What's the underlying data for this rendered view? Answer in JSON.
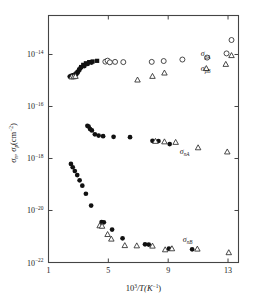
{
  "chart_data": {
    "type": "scatter",
    "title": "",
    "xlabel": "10^3/T(K^-1)",
    "xlabel_parts": {
      "base": "10",
      "exp": "3",
      "mid": "/T(K",
      "sup": "−1",
      "close": ")"
    },
    "ylabel": "σn , σp(cm−2)",
    "ylabel_parts": {
      "s1": "σ",
      "sub1": "n",
      "comma": ",",
      "s2": "σ",
      "sub2": "p",
      "unit": "(cm",
      "usup": "−2",
      "uclose": ")"
    },
    "xlim": [
      1,
      13.7
    ],
    "ylim": [
      1e-22,
      3.16e-13
    ],
    "xticks": [
      1,
      5,
      9,
      13
    ],
    "xticklabels": [
      "1",
      "5",
      "9",
      "13"
    ],
    "yticks": [
      1e-14,
      1e-16,
      1e-18,
      1e-20,
      1e-22
    ],
    "yticklabels": [
      "10−14",
      "10−16",
      "10−18",
      "10−20",
      "10−22"
    ],
    "ytick_exponents": [
      "-14",
      "-16",
      "-18",
      "-20",
      "-22"
    ],
    "grid": false,
    "legend_position": "inline-right",
    "xscale": "linear",
    "yscale": "log",
    "annotations": [
      {
        "name": "sigma-pA",
        "text": "σ",
        "sub": "pA",
        "x": 11.5,
        "y": 1.1e-14
      },
      {
        "name": "sigma-pB",
        "text": "σ",
        "sub": "pB",
        "x": 11.5,
        "y": 3.1e-15
      },
      {
        "name": "sigma-nA",
        "text": "σ",
        "sub": "nA",
        "x": 10.1,
        "y": 2e-18
      },
      {
        "name": "sigma-nB",
        "text": "σ",
        "sub": "nB",
        "x": 10.3,
        "y": 8e-22
      }
    ],
    "series": [
      {
        "name": "sigma-pA-filled",
        "marker": "filled-square",
        "legend": "σpA",
        "points": [
          [
            2.55,
            1.5e-15
          ],
          [
            2.62,
            1.55e-15
          ],
          [
            2.7,
            1.6e-15
          ],
          [
            2.78,
            1.68e-15
          ],
          [
            2.88,
            1.9e-15
          ],
          [
            2.95,
            2.1e-15
          ],
          [
            3.05,
            2.6e-15
          ],
          [
            3.18,
            3.3e-15
          ],
          [
            3.32,
            4e-15
          ],
          [
            3.5,
            4.6e-15
          ],
          [
            3.72,
            5.1e-15
          ],
          [
            3.95,
            5.4e-15
          ],
          [
            4.25,
            5.7e-15
          ]
        ]
      },
      {
        "name": "sigma-pA-filled-circles",
        "marker": "filled-circle",
        "legend": "σpA",
        "points": [
          [
            2.42,
            1.42e-15
          ],
          [
            2.5,
            1.45e-15
          ],
          [
            2.58,
            1.48e-15
          ],
          [
            2.66,
            1.55e-15
          ],
          [
            2.74,
            1.62e-15
          ],
          [
            2.84,
            1.75e-15
          ],
          [
            3.0,
            2.3e-15
          ],
          [
            3.12,
            2.9e-15
          ],
          [
            3.4,
            3.6e-15
          ],
          [
            3.62,
            4.3e-15
          ],
          [
            3.88,
            4.9e-15
          ]
        ]
      },
      {
        "name": "sigma-pA-open",
        "marker": "open-circle",
        "legend": "σpA",
        "points": [
          [
            4.8,
            5.3e-15
          ],
          [
            4.95,
            5.8e-15
          ],
          [
            5.1,
            5e-15
          ],
          [
            5.45,
            5.2e-15
          ],
          [
            6.0,
            5.1e-15
          ],
          [
            7.9,
            5.2e-15
          ],
          [
            8.7,
            5.6e-15
          ],
          [
            9.95,
            6.4e-15
          ],
          [
            11.6,
            7.6e-15
          ],
          [
            12.9,
            1.1e-14
          ]
        ]
      },
      {
        "name": "sigma-pB-open",
        "marker": "open-triangle",
        "legend": "σpB",
        "points": [
          [
            2.55,
            1.38e-15
          ],
          [
            2.68,
            1.4e-15
          ],
          [
            2.8,
            1.45e-15
          ],
          [
            6.95,
            1.05e-15
          ],
          [
            7.95,
            1.45e-15
          ],
          [
            8.75,
            1.95e-15
          ],
          [
            11.55,
            2.9e-15
          ],
          [
            12.85,
            4.2e-15
          ]
        ]
      },
      {
        "name": "sigma-nA-filled",
        "marker": "filled-circle",
        "legend": "σnA",
        "points": [
          [
            3.6,
            1.8e-17
          ],
          [
            3.68,
            1.7e-17
          ],
          [
            3.78,
            1.35e-17
          ],
          [
            3.9,
            1.2e-17
          ],
          [
            4.1,
            8.5e-18
          ],
          [
            4.35,
            7.6e-18
          ],
          [
            4.65,
            7.2e-18
          ],
          [
            5.35,
            6.8e-18
          ],
          [
            6.45,
            6.6e-18
          ],
          [
            7.95,
            4.8e-18
          ],
          [
            8.35,
            4.7e-18
          ],
          [
            9.1,
            3.6e-18
          ]
        ]
      },
      {
        "name": "sigma-nA-open",
        "marker": "open-triangle",
        "legend": "σnA",
        "points": [
          [
            8.15,
            4.6e-18
          ],
          [
            8.75,
            4.4e-18
          ],
          [
            9.5,
            4.2e-18
          ],
          [
            11.0,
            2.6e-18
          ],
          [
            12.95,
            1.8e-18
          ]
        ]
      },
      {
        "name": "sigma-nB-filled",
        "marker": "filled-circle",
        "legend": "σnB",
        "points": [
          [
            2.5,
            6.2e-19
          ],
          [
            2.62,
            4.6e-19
          ],
          [
            2.76,
            3.3e-19
          ],
          [
            2.92,
            2.3e-19
          ],
          [
            3.08,
            1.45e-19
          ],
          [
            3.26,
            9e-20
          ],
          [
            3.5,
            4.4e-20
          ],
          [
            3.85,
            1.55e-20
          ],
          [
            4.55,
            3.6e-21
          ],
          [
            4.7,
            3.5e-21
          ],
          [
            5.25,
            1.85e-21
          ],
          [
            5.95,
            8.5e-22
          ],
          [
            7.45,
            5e-22
          ],
          [
            7.7,
            4.9e-22
          ],
          [
            9.05,
            3.4e-22
          ],
          [
            10.6,
            3.2e-22
          ]
        ]
      },
      {
        "name": "sigma-nB-open",
        "marker": "open-triangle",
        "legend": "σnB",
        "points": [
          [
            4.42,
            2.6e-21
          ],
          [
            4.58,
            2.5e-21
          ],
          [
            4.95,
            1.2e-21
          ],
          [
            5.2,
            8e-22
          ],
          [
            6.1,
            4.5e-22
          ],
          [
            6.9,
            4.4e-22
          ],
          [
            7.95,
            4.3e-22
          ],
          [
            8.8,
            3.1e-22
          ],
          [
            9.25,
            3.4e-22
          ],
          [
            10.95,
            3.3e-22
          ],
          [
            13.05,
            2.4e-22
          ]
        ]
      }
    ]
  }
}
